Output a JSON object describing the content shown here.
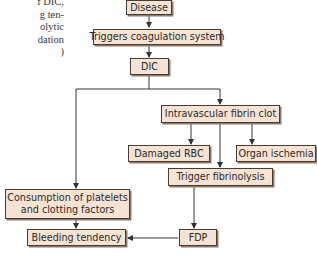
{
  "left_text_fragment": [
    "f DIC,",
    "g  ten-",
    "olytic",
    "dation",
    ")"
  ],
  "nodes": {
    "disease": "Disease",
    "triggers_coagulation": "Triggers coagulation system",
    "dic": "DIC",
    "intravascular_clot": "Intravascular fibrin clot",
    "damaged_rbc": "Damaged RBC",
    "organ_ischemia": "Organ ischemia",
    "trigger_fibrinolysis": "Trigger fibrinolysis",
    "consumption_line1": "Consumption of platelets",
    "consumption_line2": "and clotting factors",
    "bleeding_tendency": "Bleeding tendency",
    "fdp": "FDP"
  },
  "colors": {
    "box_fill": "#f6e3d3",
    "box_border": "#4a3a30",
    "line": "#333333"
  },
  "edges": [
    [
      "Disease",
      "Triggers coagulation system"
    ],
    [
      "Triggers coagulation system",
      "DIC"
    ],
    [
      "DIC",
      "Intravascular fibrin clot"
    ],
    [
      "DIC",
      "Consumption of platelets and clotting factors"
    ],
    [
      "Intravascular fibrin clot",
      "Damaged RBC"
    ],
    [
      "Intravascular fibrin clot",
      "Organ ischemia"
    ],
    [
      "Intravascular fibrin clot",
      "Trigger fibrinolysis"
    ],
    [
      "Trigger fibrinolysis",
      "FDP"
    ],
    [
      "FDP",
      "Bleeding tendency"
    ],
    [
      "Consumption of platelets and clotting factors",
      "Bleeding tendency"
    ]
  ]
}
